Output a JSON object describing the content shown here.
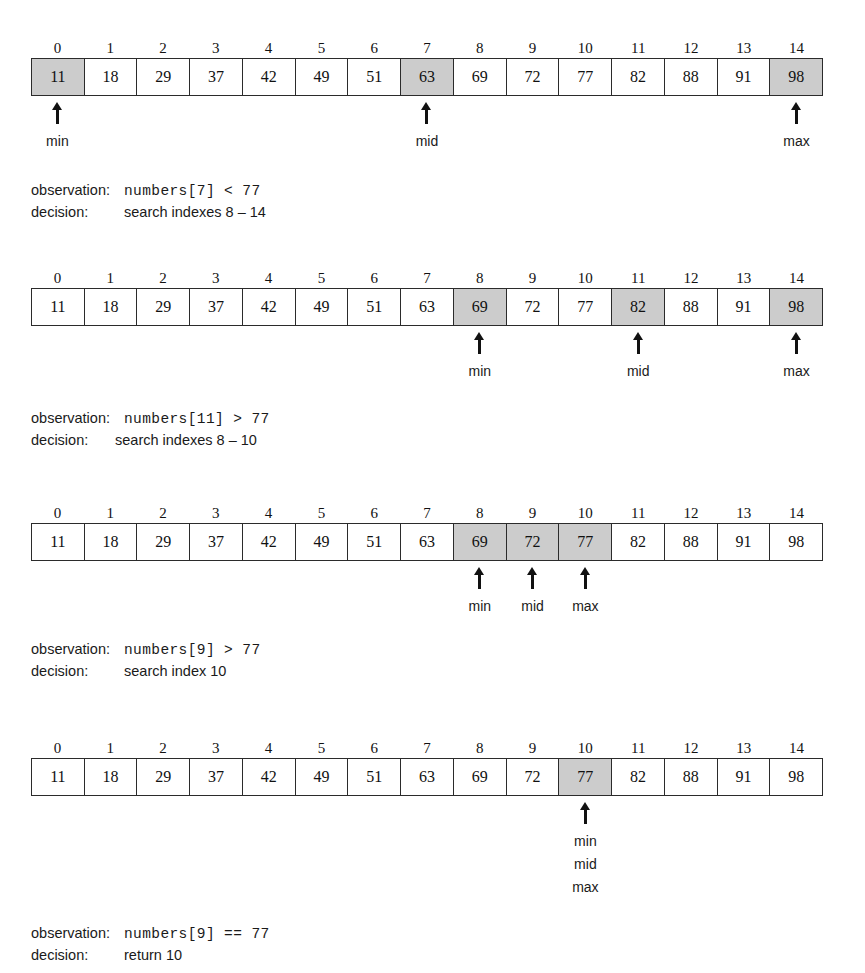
{
  "figure": {
    "type": "binary-search-trace",
    "target_value": 77,
    "array_values": [
      11,
      18,
      29,
      37,
      42,
      49,
      51,
      63,
      69,
      72,
      77,
      82,
      88,
      91,
      98
    ],
    "index_labels": [
      "0",
      "1",
      "2",
      "3",
      "4",
      "5",
      "6",
      "7",
      "8",
      "9",
      "10",
      "11",
      "12",
      "13",
      "14"
    ],
    "shade_color": "#cccccc",
    "border_color": "#2b2b2b"
  },
  "steps": [
    {
      "id": "step-1",
      "top": 38,
      "indexes": [
        "0",
        "1",
        "2",
        "3",
        "4",
        "5",
        "6",
        "7",
        "8",
        "9",
        "10",
        "11",
        "12",
        "13",
        "14"
      ],
      "values": [
        "11",
        "18",
        "29",
        "37",
        "42",
        "49",
        "51",
        "63",
        "69",
        "72",
        "77",
        "82",
        "88",
        "91",
        "98"
      ],
      "shaded": [
        0,
        7,
        14
      ],
      "pointers": [
        {
          "index": 0,
          "labels": [
            "min"
          ]
        },
        {
          "index": 7,
          "labels": [
            "mid"
          ]
        },
        {
          "index": 14,
          "labels": [
            "max"
          ]
        }
      ],
      "caption_top": 182,
      "caption_indent": 93,
      "observation_key": "observation:",
      "observation_code": "numbers[7] < 77",
      "decision_key": "decision:",
      "decision_text": "search indexes 8 – 14"
    },
    {
      "id": "step-2",
      "top": 268,
      "indexes": [
        "0",
        "1",
        "2",
        "3",
        "4",
        "5",
        "6",
        "7",
        "8",
        "9",
        "10",
        "11",
        "12",
        "13",
        "14"
      ],
      "values": [
        "11",
        "18",
        "29",
        "37",
        "42",
        "49",
        "51",
        "63",
        "69",
        "72",
        "77",
        "82",
        "88",
        "91",
        "98"
      ],
      "shaded": [
        8,
        11,
        14
      ],
      "pointers": [
        {
          "index": 8,
          "labels": [
            "min"
          ]
        },
        {
          "index": 11,
          "labels": [
            "mid"
          ]
        },
        {
          "index": 14,
          "labels": [
            "max"
          ]
        }
      ],
      "caption_top": 410,
      "caption_indent": 84,
      "observation_key": "observation:",
      "observation_code": "numbers[11] > 77",
      "decision_key": "decision:",
      "decision_text": "search indexes 8 – 10"
    },
    {
      "id": "step-3",
      "top": 503,
      "indexes": [
        "0",
        "1",
        "2",
        "3",
        "4",
        "5",
        "6",
        "7",
        "8",
        "9",
        "10",
        "11",
        "12",
        "13",
        "14"
      ],
      "values": [
        "11",
        "18",
        "29",
        "37",
        "42",
        "49",
        "51",
        "63",
        "69",
        "72",
        "77",
        "82",
        "88",
        "91",
        "98"
      ],
      "shaded": [
        8,
        9,
        10
      ],
      "pointers": [
        {
          "index": 8,
          "labels": [
            "min"
          ]
        },
        {
          "index": 9,
          "labels": [
            "mid"
          ]
        },
        {
          "index": 10,
          "labels": [
            "max"
          ]
        }
      ],
      "caption_top": 641,
      "caption_indent": 93,
      "observation_key": "observation:",
      "observation_code": "numbers[9] > 77",
      "decision_key": "decision:",
      "decision_text": "search index 10"
    },
    {
      "id": "step-4",
      "top": 738,
      "indexes": [
        "0",
        "1",
        "2",
        "3",
        "4",
        "5",
        "6",
        "7",
        "8",
        "9",
        "10",
        "11",
        "12",
        "13",
        "14"
      ],
      "values": [
        "11",
        "18",
        "29",
        "37",
        "42",
        "49",
        "51",
        "63",
        "69",
        "72",
        "77",
        "82",
        "88",
        "91",
        "98"
      ],
      "shaded": [
        10
      ],
      "pointers": [
        {
          "index": 10,
          "labels": [
            "min",
            "mid",
            "max"
          ]
        }
      ],
      "caption_top": 925,
      "caption_indent": 93,
      "observation_key": "observation:",
      "observation_code": "numbers[9] == 77",
      "decision_key": "decision:",
      "decision_text": "return 10"
    }
  ]
}
